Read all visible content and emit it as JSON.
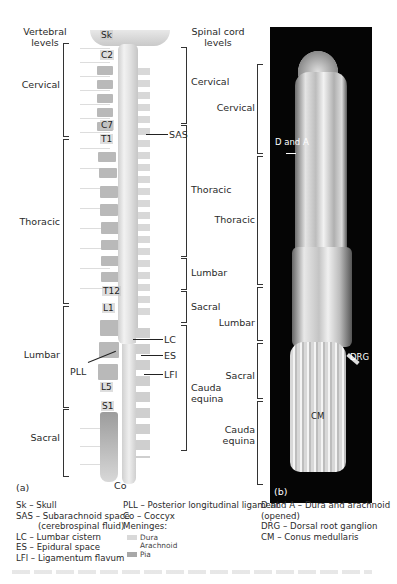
{
  "panel_a": {
    "label": "(a)",
    "column_titles": {
      "vertebral": [
        "Vertebral",
        "levels"
      ],
      "spinal_cord": [
        "Spinal cord",
        "levels"
      ]
    },
    "vertebral_levels": [
      "Cervical",
      "Thoracic",
      "Lumbar",
      "Sacral"
    ],
    "spinal_cord_levels": [
      "Cervical",
      "Thoracic",
      "Lumbar",
      "Sacral",
      "Cauda equina"
    ],
    "vertebra_tags": [
      "Sk",
      "C2",
      "C7",
      "T1",
      "T12",
      "L1",
      "L5",
      "S1",
      "Co"
    ],
    "pointer_labels": [
      "SAS",
      "LC",
      "ES",
      "LFl",
      "PLL"
    ]
  },
  "panel_b": {
    "label": "(b)",
    "levels": [
      "Cervical",
      "Thoracic",
      "Lumbar",
      "Sacral",
      "Cauda equina"
    ],
    "pointer_labels": [
      "D and A",
      "DRG",
      "CM"
    ]
  },
  "legend": {
    "col1": [
      "Sk – Skull",
      "SAS – Subarachnoid space",
      "(cerebrospinal fluid)",
      "LC – Lumbar cistern",
      "ES – Epidural space",
      "LFl – Ligamentum flavum"
    ],
    "col2": [
      "PLL – Posterior longitudinal ligament",
      "Co – Coccyx",
      "Meninges:"
    ],
    "meninges": [
      {
        "name": "Dura",
        "color": "#d9d9d9"
      },
      {
        "name": "Arachnoid",
        "color": "#ffffff"
      },
      {
        "name": "Pia",
        "color": "#a8a8a8"
      }
    ],
    "col3": [
      "D and A – Dura and arachnoid",
      "(opened)",
      "DRG – Dorsal root ganglion",
      "CM – Conus medullaris"
    ]
  }
}
